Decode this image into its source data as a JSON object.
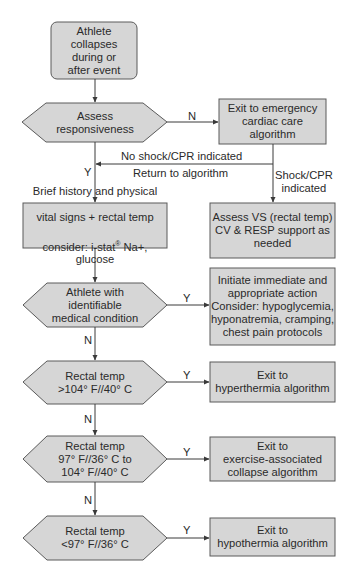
{
  "colors": {
    "fill": "#d6d6d6",
    "stroke": "#5a5a5a",
    "text": "#2a2a2a",
    "background": "#ffffff"
  },
  "nodes": {
    "start": {
      "shape": "rounded-rect",
      "text": "Athlete\ncollapses\nduring or\nafter event"
    },
    "assess_responsiveness": {
      "shape": "hexagon",
      "text": "Assess\nresponsiveness"
    },
    "exit_emergency": {
      "shape": "rect",
      "text": "Exit to emergency\ncardiac care\nalgorithm"
    },
    "brief_history": {
      "shape": "rect",
      "text_line1": "Brief history and physical",
      "text_line2": "vital signs + rectal temp",
      "text_line3_pre": "consider: i-stat",
      "text_line3_sup": "®",
      "text_line3_post": " Na+, glucose"
    },
    "assess_vs": {
      "shape": "rect",
      "text": "Assess VS (rectal temp)\nCV & RESP support as\nneeded"
    },
    "medical_condition": {
      "shape": "hexagon",
      "text": "Athlete with\nidentifiable\nmedical condition"
    },
    "initiate_action": {
      "shape": "rect",
      "text": "Initiate immediate and\nappropriate action\nConsider: hypoglycemia,\nhyponatremia, cramping,\nchest pain protocols"
    },
    "temp_high": {
      "shape": "hexagon",
      "text": "Rectal temp\n>104° F//40° C"
    },
    "exit_hyperthermia": {
      "shape": "rect",
      "text": "Exit to\nhyperthermia algorithm"
    },
    "temp_mid": {
      "shape": "hexagon",
      "text": "Rectal temp\n97° F//36° C to\n104° F//40° C"
    },
    "exit_eac": {
      "shape": "rect",
      "text": "Exit to\nexercise-associated\ncollapse algorithm"
    },
    "temp_low": {
      "shape": "hexagon",
      "text": "Rectal temp\n<97° F//36° C"
    },
    "exit_hypothermia": {
      "shape": "rect",
      "text": "Exit to\nhypothermia algorithm"
    }
  },
  "edge_labels": {
    "assess_no": "N",
    "assess_yes": "Y",
    "no_shock": "No shock/CPR indicated",
    "return_to_algorithm": "Return to algorithm",
    "shock_cpr": "Shock/CPR\nindicated",
    "medical_yes": "Y",
    "medical_no": "N",
    "high_yes": "Y",
    "high_no": "N",
    "mid_yes": "Y",
    "mid_no": "N",
    "low_yes": "Y"
  },
  "edges": [
    {
      "from": "start",
      "to": "assess_responsiveness"
    },
    {
      "from": "assess_responsiveness",
      "to": "exit_emergency",
      "label": "N"
    },
    {
      "from": "assess_responsiveness",
      "to": "brief_history",
      "label": "Y"
    },
    {
      "from": "exit_emergency",
      "to": "assess_responsiveness_line",
      "label": "No shock/CPR indicated / Return to algorithm"
    },
    {
      "from": "exit_emergency",
      "to": "assess_vs",
      "label": "Shock/CPR indicated"
    },
    {
      "from": "brief_history",
      "to": "medical_condition"
    },
    {
      "from": "medical_condition",
      "to": "initiate_action",
      "label": "Y"
    },
    {
      "from": "medical_condition",
      "to": "temp_high",
      "label": "N"
    },
    {
      "from": "temp_high",
      "to": "exit_hyperthermia",
      "label": "Y"
    },
    {
      "from": "temp_high",
      "to": "temp_mid",
      "label": "N"
    },
    {
      "from": "temp_mid",
      "to": "exit_eac",
      "label": "Y"
    },
    {
      "from": "temp_mid",
      "to": "temp_low",
      "label": "N"
    },
    {
      "from": "temp_low",
      "to": "exit_hypothermia",
      "label": "Y"
    }
  ]
}
